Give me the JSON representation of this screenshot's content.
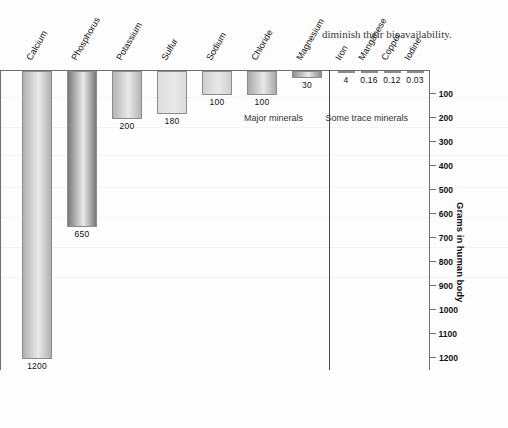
{
  "chart_data": {
    "type": "bar",
    "title": "",
    "xlabel": "",
    "ylabel": "Grams in human body",
    "ylim": [
      0,
      1250
    ],
    "grid": false,
    "orientation": "vertical",
    "rotated_180": true,
    "categories": [
      "Iodine",
      "Copper",
      "Manganese",
      "Iron",
      "Magnesium",
      "Chloride",
      "Sodium",
      "Sulfur",
      "Potassium",
      "Phosphorus",
      "Calcium"
    ],
    "values": [
      0.03,
      0.12,
      0.16,
      4,
      30,
      100,
      100,
      180,
      200,
      650,
      1200
    ],
    "value_labels": [
      "0.03",
      "0.12",
      "0.16",
      "4",
      "30",
      "100",
      "100",
      "180",
      "200",
      "650",
      "1200"
    ],
    "bar_colors": [
      "#b8b8b8",
      "#bdbdbd",
      "#c0c0c0",
      "#a9a9a9",
      "#8f8f8f",
      "#a8a8a8",
      "#cfcfcf",
      "#dcdcdc",
      "#b5b5b5",
      "#7a7a7a",
      "#b0b0b0"
    ],
    "groups": [
      {
        "label": "Some trace minerals",
        "members": [
          "Iodine",
          "Copper",
          "Manganese",
          "Iron"
        ]
      },
      {
        "label": "Major minerals",
        "members": [
          "Magnesium",
          "Chloride",
          "Sodium",
          "Sulfur",
          "Potassium",
          "Phosphorus",
          "Calcium"
        ]
      }
    ],
    "yticks": [
      100,
      200,
      300,
      400,
      500,
      600,
      700,
      800,
      900,
      1000,
      1100,
      1200
    ],
    "ytick_labels": [
      "100",
      "200",
      "300",
      "400",
      "500",
      "600",
      "700",
      "800",
      "900",
      "1000",
      "1100",
      "1200"
    ],
    "legend": [],
    "annotations": []
  },
  "page": {
    "trailing_text": "diminish their bioavailability."
  }
}
